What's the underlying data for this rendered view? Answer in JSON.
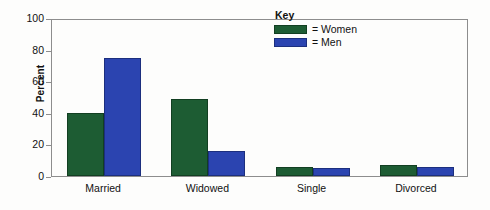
{
  "chart_data": {
    "type": "bar",
    "title": "",
    "subtitle": "",
    "xlabel": "",
    "ylabel": "Percent",
    "categories": [
      "Married",
      "Widowed",
      "Single",
      "Divorced"
    ],
    "series": [
      {
        "name": "Women",
        "values": [
          40,
          49,
          6,
          7
        ],
        "color": "#1d5c33"
      },
      {
        "name": "Men",
        "values": [
          75,
          16,
          5,
          6
        ],
        "color": "#2b44b0"
      }
    ],
    "ylim": [
      0,
      100
    ],
    "yticks": [
      0,
      20,
      40,
      60,
      80,
      100
    ],
    "ytick_labels": [
      "0",
      "20",
      "40",
      "60",
      "80",
      "100"
    ],
    "grid": false,
    "legend_position": "top-right-inside",
    "legend": {
      "title": "Key",
      "entries": [
        {
          "label": "= Women",
          "color": "#1d5c33"
        },
        {
          "label": "= Men",
          "color": "#2b44b0"
        }
      ]
    }
  },
  "colors": {
    "women": "#1d5c33",
    "men": "#2b44b0",
    "frame": "#8d8d8d",
    "background": "#fdfdfc",
    "text": "#111111"
  }
}
